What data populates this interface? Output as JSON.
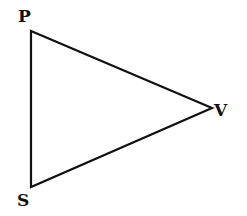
{
  "diagram": {
    "type": "triangle",
    "vertices": [
      {
        "label": "P",
        "x": 31,
        "y": 31,
        "label_x": 18,
        "label_y": 22
      },
      {
        "label": "V",
        "x": 212,
        "y": 108,
        "label_x": 215,
        "label_y": 116
      },
      {
        "label": "S",
        "x": 31,
        "y": 187,
        "label_x": 17,
        "label_y": 206
      }
    ],
    "edges": [
      [
        "P",
        "V"
      ],
      [
        "V",
        "S"
      ],
      [
        "S",
        "P"
      ]
    ],
    "stroke_color": "#111111"
  }
}
